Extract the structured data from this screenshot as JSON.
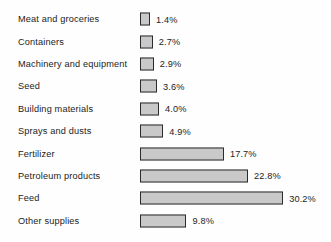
{
  "chart_data": {
    "type": "bar",
    "orientation": "horizontal",
    "title": "",
    "xlabel": "",
    "ylabel": "",
    "categories": [
      "Meat and groceries",
      "Containers",
      "Machinery and equipment",
      "Seed",
      "Building materials",
      "Sprays and dusts",
      "Fertilizer",
      "Petroleum products",
      "Feed",
      "Other supplies"
    ],
    "values": [
      1.4,
      2.7,
      2.9,
      3.6,
      4.0,
      4.9,
      17.7,
      22.8,
      30.2,
      9.8
    ],
    "value_labels": [
      "1.4%",
      "2.7%",
      "2.9%",
      "3.6%",
      "4.0%",
      "4.9%",
      "17.7%",
      "22.8%",
      "30.2%",
      "9.8%"
    ],
    "xlim": [
      0,
      30.2
    ],
    "grid": false,
    "legend": false,
    "bar_fill_color": "#c9c9c9",
    "bar_border_color": "#2b2b2b",
    "background_color": "#fefefe",
    "text_color": "#1c1c1c"
  },
  "rows": [
    {
      "label": "Meat and groceries",
      "value": 1.4,
      "value_label": "1.4%"
    },
    {
      "label": "Containers",
      "value": 2.7,
      "value_label": "2.7%"
    },
    {
      "label": "Machinery and equipment",
      "value": 2.9,
      "value_label": "2.9%"
    },
    {
      "label": "Seed",
      "value": 3.6,
      "value_label": "3.6%"
    },
    {
      "label": "Building materials",
      "value": 4.0,
      "value_label": "4.0%"
    },
    {
      "label": "Sprays and dusts",
      "value": 4.9,
      "value_label": "4.9%"
    },
    {
      "label": "Fertilizer",
      "value": 17.7,
      "value_label": "17.7%"
    },
    {
      "label": "Petroleum products",
      "value": 22.8,
      "value_label": "22.8%"
    },
    {
      "label": "Feed",
      "value": 30.2,
      "value_label": "30.2%"
    },
    {
      "label": "Other supplies",
      "value": 9.8,
      "value_label": "9.8%"
    }
  ],
  "scale": {
    "px_per_percent": 4.74,
    "min_bar_px": 10
  }
}
